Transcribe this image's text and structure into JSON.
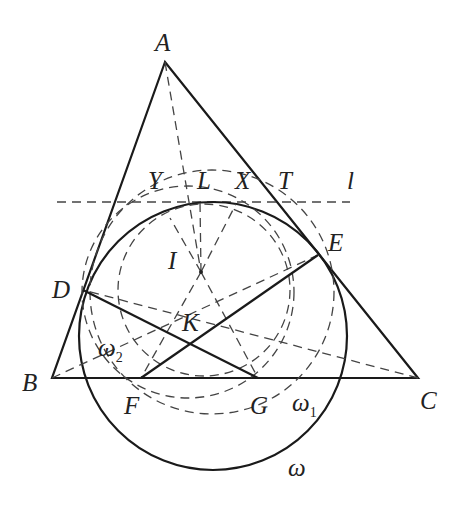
{
  "diagram": {
    "type": "geometry-figure",
    "points": {
      "A": {
        "label": "A",
        "x": 165,
        "y": 62
      },
      "B": {
        "label": "B",
        "x": 52,
        "y": 378
      },
      "C": {
        "label": "C",
        "x": 418,
        "y": 378
      },
      "D": {
        "label": "D",
        "x": 83,
        "y": 290
      },
      "E": {
        "label": "E",
        "x": 318,
        "y": 255
      },
      "F": {
        "label": "F",
        "x": 141,
        "y": 378
      },
      "G": {
        "label": "G",
        "x": 258,
        "y": 378
      },
      "I": {
        "label": "I",
        "x": 201,
        "y": 272
      },
      "K": {
        "label": "K",
        "x": 193,
        "y": 342
      },
      "L": {
        "label": "L",
        "x": 200,
        "y": 202
      },
      "X": {
        "label": "X",
        "x": 240,
        "y": 202
      },
      "Y": {
        "label": "Y",
        "x": 155,
        "y": 202
      },
      "T": {
        "label": "T",
        "x": 290,
        "y": 202
      }
    },
    "labels": {
      "A": "A",
      "B": "B",
      "C": "C",
      "D": "D",
      "E": "E",
      "F": "F",
      "G": "G",
      "I": "I",
      "K": "K",
      "L": "L",
      "X": "X",
      "Y": "Y",
      "T": "T",
      "l": "l",
      "omega": "ω",
      "omega1": "ω",
      "omega1_sub": "1",
      "omega2": "ω",
      "omega2_sub": "2"
    },
    "circles": {
      "omega": {
        "style": "solid",
        "cx": 213,
        "cy": 336,
        "r": 134
      },
      "omega1": {
        "style": "dashed",
        "cx": 212,
        "cy": 292,
        "r": 122
      },
      "omega2": {
        "style": "dashed",
        "cx": 188,
        "cy": 292,
        "r": 106
      },
      "inner": {
        "style": "dashed",
        "cx": 204,
        "cy": 290,
        "r": 86
      }
    },
    "line_l": {
      "style": "dashed",
      "y": 202,
      "x1": 57,
      "x2": 350
    }
  }
}
